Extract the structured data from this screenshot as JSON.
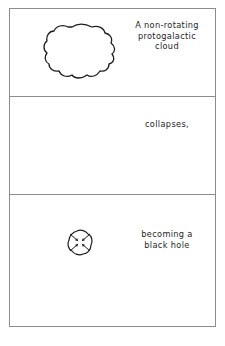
{
  "figure": {
    "background_color": "#ffffff",
    "line_color": "#1d1d1f",
    "frame_color": "#8d8d91",
    "panel_count": 3
  },
  "panels": [
    {
      "index": 1,
      "caption_lines": [
        "A non-rotating",
        "protogalactic",
        "cloud"
      ],
      "caption_full": "A non-rotating protogalactic cloud",
      "artwork": "irregular-cloud-outline",
      "artwork_description": "Large irregular closed blob outline representing a diffuse gas cloud"
    },
    {
      "index": 2,
      "caption_lines": [
        "collapses,"
      ],
      "caption_full": "collapses,",
      "artwork": "collapsing-blob-with-inward-arrows",
      "artwork_description": "Small irregular blob with inward-pointing arrows indicating gravitational collapse"
    },
    {
      "index": 3,
      "caption_lines": [
        "becoming a",
        "black hole"
      ],
      "caption_full": "becoming a black hole",
      "artwork": "none",
      "artwork_description": "Empty panel representing the black hole (no visible object)"
    }
  ]
}
